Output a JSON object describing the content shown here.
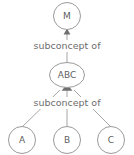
{
  "diagram": {
    "background_color": "#ffffff",
    "node_stroke_color": "#9a9a9a",
    "edge_color": "#a6a6a6",
    "text_color": "#6d6d6d",
    "nodes": [
      {
        "id": "m",
        "label": "M",
        "shape": "circle"
      },
      {
        "id": "abc",
        "label": "ABC",
        "shape": "ellipse"
      },
      {
        "id": "a",
        "label": "A",
        "shape": "circle"
      },
      {
        "id": "b",
        "label": "B",
        "shape": "circle"
      },
      {
        "id": "c",
        "label": "C",
        "shape": "circle"
      }
    ],
    "edge_labels": [
      {
        "id": "edge-label-top",
        "text": "subconcept of"
      },
      {
        "id": "edge-label-bottom",
        "text": "subconcept of"
      }
    ]
  }
}
